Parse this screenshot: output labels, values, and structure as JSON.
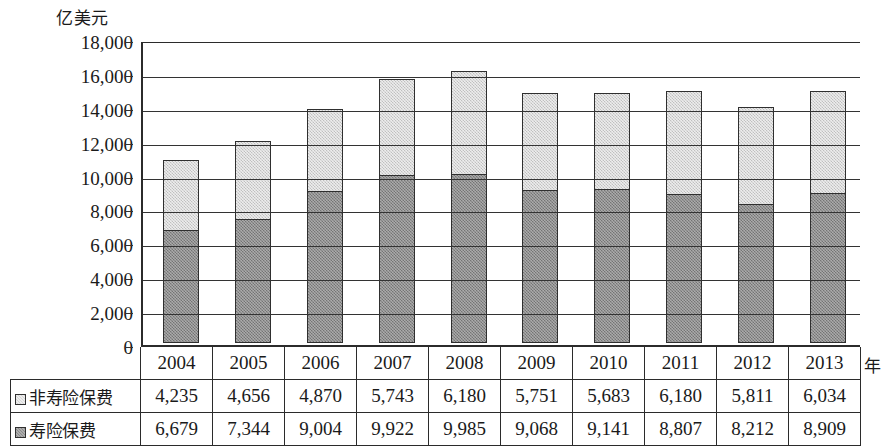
{
  "chart_data": {
    "type": "bar",
    "stacked": true,
    "title": "",
    "subtitle": "",
    "xlabel": "年",
    "ylabel": "亿美元",
    "ylim": [
      0,
      18000
    ],
    "ytick_step": 2000,
    "ytick_labels": [
      "18,000",
      "16,000",
      "14,000",
      "12,000",
      "10,000",
      "8,000",
      "6,000",
      "4,000",
      "2,000",
      "0"
    ],
    "ytick_values": [
      18000,
      16000,
      14000,
      12000,
      10000,
      8000,
      6000,
      4000,
      2000,
      0
    ],
    "grid": true,
    "grid_axis": "y",
    "legend_position": "table-row-headers",
    "categories": [
      "2004",
      "2005",
      "2006",
      "2007",
      "2008",
      "2009",
      "2010",
      "2011",
      "2012",
      "2013"
    ],
    "series": [
      {
        "name": "寿险保费",
        "stack_order": "bottom",
        "color": "#8a8a8a",
        "values": [
          6679,
          7344,
          9004,
          9922,
          9985,
          9068,
          9141,
          8807,
          8212,
          8909
        ],
        "labels": [
          "6,679",
          "7,344",
          "9,004",
          "9,922",
          "9,985",
          "9,068",
          "9,141",
          "8,807",
          "8,212",
          "8,909"
        ]
      },
      {
        "name": "非寿险保费",
        "stack_order": "top",
        "color": "#d6d6d6",
        "values": [
          4235,
          4656,
          4870,
          5743,
          6180,
          5751,
          5683,
          6180,
          5811,
          6034
        ],
        "labels": [
          "4,235",
          "4,656",
          "4,870",
          "5,743",
          "6,180",
          "5,751",
          "5,683",
          "6,180",
          "5,811",
          "6,034"
        ]
      }
    ]
  },
  "axis": {
    "y_unit_label": "亿美元",
    "x_unit_label": "年"
  },
  "table": {
    "years": [
      "2004",
      "2005",
      "2006",
      "2007",
      "2008",
      "2009",
      "2010",
      "2011",
      "2012",
      "2013"
    ],
    "rows": [
      {
        "label": "非寿险保费",
        "swatch": "light-gray-swatch",
        "values": [
          "4,235",
          "4,656",
          "4,870",
          "5,743",
          "6,180",
          "5,751",
          "5,683",
          "6,180",
          "5,811",
          "6,034"
        ]
      },
      {
        "label": "寿险保费",
        "swatch": "dark-gray-swatch",
        "values": [
          "6,679",
          "7,344",
          "9,004",
          "9,922",
          "9,985",
          "9,068",
          "9,141",
          "8,807",
          "8,212",
          "8,909"
        ]
      }
    ]
  }
}
